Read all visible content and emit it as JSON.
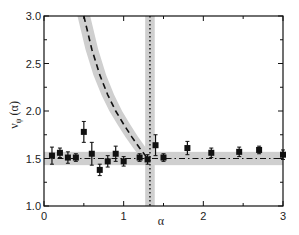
{
  "chart_data": {
    "type": "scatter",
    "title": "",
    "xlabel": "α",
    "ylabel": "ν_ψ(α)",
    "xlim": [
      0,
      3
    ],
    "ylim": [
      1.0,
      3.0
    ],
    "x_ticks": [
      "0",
      "1",
      "2",
      "3"
    ],
    "y_ticks": [
      "1.0",
      "1.5",
      "2.0",
      "2.5",
      "3.0"
    ],
    "grid": false,
    "legend": null,
    "series": [
      {
        "name": "data",
        "marker": "square",
        "x": [
          0.1,
          0.2,
          0.3,
          0.4,
          0.5,
          0.6,
          0.7,
          0.8,
          0.9,
          1.0,
          1.2,
          1.3,
          1.4,
          1.5,
          1.8,
          2.1,
          2.45,
          2.7,
          3.0
        ],
        "y": [
          1.53,
          1.56,
          1.51,
          1.51,
          1.78,
          1.55,
          1.38,
          1.47,
          1.55,
          1.47,
          1.51,
          1.49,
          1.64,
          1.51,
          1.61,
          1.56,
          1.57,
          1.59,
          1.54
        ],
        "err": [
          0.09,
          0.05,
          0.06,
          0.04,
          0.11,
          0.12,
          0.06,
          0.06,
          0.08,
          0.05,
          0.04,
          0.05,
          0.11,
          0.04,
          0.07,
          0.05,
          0.05,
          0.04,
          0.05
        ]
      },
      {
        "name": "constant fit",
        "style": "dash-dot",
        "y": 1.5,
        "band": [
          1.43,
          1.57
        ]
      },
      {
        "name": "curve fit",
        "style": "dashed",
        "x": [
          0.5,
          0.6,
          0.7,
          0.8,
          0.9,
          1.0,
          1.1,
          1.2,
          1.3
        ],
        "y": [
          3.0,
          2.65,
          2.38,
          2.17,
          2.0,
          1.86,
          1.73,
          1.61,
          1.5
        ],
        "band_halfwidth": 0.08
      },
      {
        "name": "vertical marker",
        "style": "dotted",
        "x": 1.33,
        "band": [
          1.27,
          1.39
        ]
      }
    ]
  }
}
